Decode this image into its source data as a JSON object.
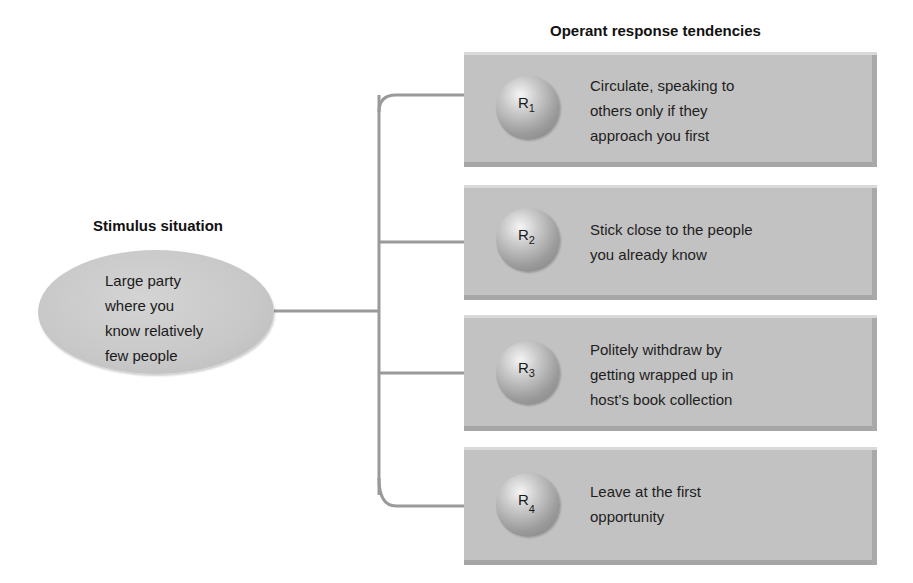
{
  "diagram": {
    "stimulus": {
      "heading": "Stimulus situation",
      "lines": [
        "Large party",
        "where you",
        "know relatively",
        "few people"
      ]
    },
    "responses_heading": "Operant response tendencies",
    "responses": [
      {
        "label": "R",
        "sub": "1",
        "lines": [
          "Circulate, speaking to",
          "others only if they",
          "approach you first"
        ]
      },
      {
        "label": "R",
        "sub": "2",
        "lines": [
          "Stick close to the people",
          "you already know"
        ]
      },
      {
        "label": "R",
        "sub": "3",
        "lines": [
          "Politely withdraw by",
          "getting wrapped up in",
          "host’s book collection"
        ]
      },
      {
        "label": "R",
        "sub": "4",
        "lines": [
          "Leave at the first",
          "opportunity"
        ]
      }
    ],
    "colors": {
      "box_fill": "#c2c2c2",
      "ellipse_fill": "#c8c8c8",
      "connector": "#8a8a8a",
      "text": "#1a1a1a"
    }
  }
}
